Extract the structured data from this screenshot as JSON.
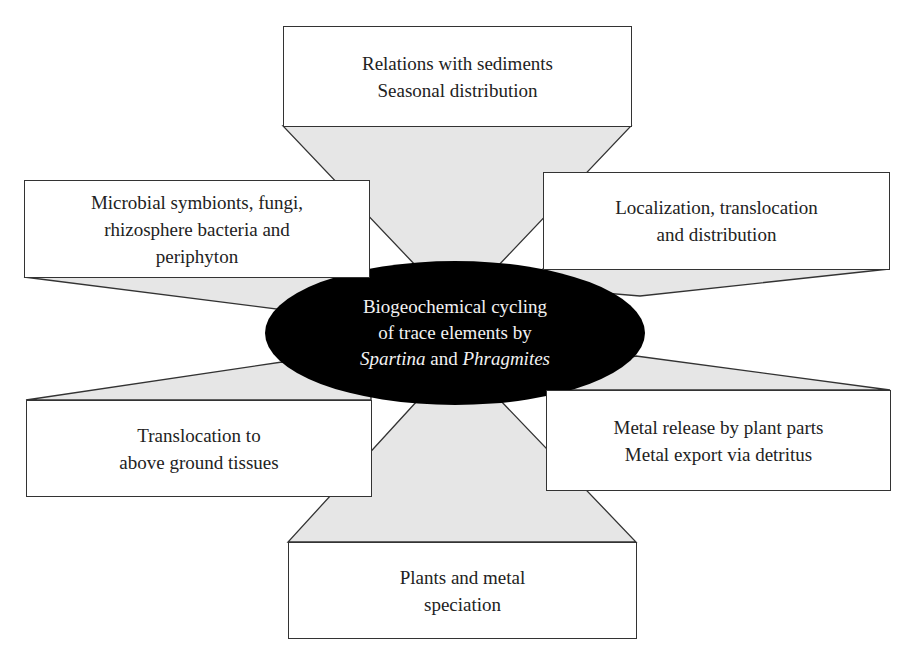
{
  "diagram": {
    "center": {
      "line1": "Biogeochemical cycling",
      "line2": "of trace elements by",
      "line3_italic_a": "Spartina",
      "line3_mid": " and ",
      "line3_italic_b": "Phragmites"
    },
    "nodes": {
      "top": {
        "lines": [
          "Relations with sediments",
          "Seasonal distribution"
        ]
      },
      "upper_left": {
        "lines": [
          "Microbial symbionts, fungi,",
          "rhizosphere bacteria and",
          "periphyton"
        ]
      },
      "upper_right": {
        "lines": [
          "Localization, translocation",
          "and distribution"
        ]
      },
      "lower_left": {
        "lines": [
          "Translocation to",
          "above ground tissues"
        ]
      },
      "lower_right": {
        "lines": [
          "Metal release by plant parts",
          "Metal export via detritus"
        ]
      },
      "bottom": {
        "lines": [
          "Plants and metal",
          "speciation"
        ]
      }
    },
    "colors": {
      "connector_fill": "#e6e6e6",
      "center_fill": "#000000",
      "center_text": "#f2f2f2",
      "stroke": "#333333"
    }
  }
}
